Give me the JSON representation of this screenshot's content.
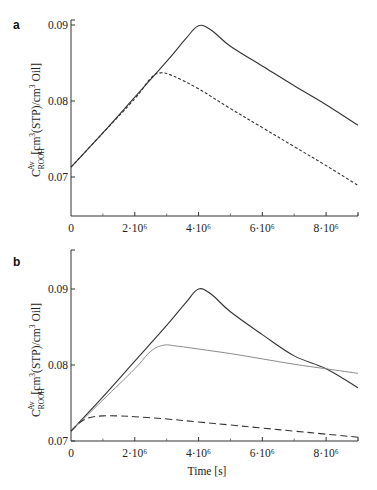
{
  "chart_data": [
    {
      "panel": "a",
      "type": "line",
      "title": "",
      "xlabel": "",
      "ylabel": "C_ROOH^Av [cm3(STP)/cm3 Oil]",
      "xlim": [
        0,
        9000000
      ],
      "ylim": [
        0.065,
        0.09
      ],
      "grid": false,
      "legend": null,
      "x_ticks": [
        0,
        2000000,
        4000000,
        6000000,
        8000000
      ],
      "x_tick_labels": [
        "0",
        "2·10⁶",
        "4·10⁶",
        "6·10⁶",
        "8·10⁶"
      ],
      "x_minor_ticks": [
        1000000,
        3000000,
        5000000,
        7000000,
        9000000
      ],
      "y_ticks": [
        0.07,
        0.08,
        0.09
      ],
      "y_tick_labels": [
        "0.07",
        "0.08",
        "0.09"
      ],
      "series": [
        {
          "name": "solid",
          "style": "solid",
          "color": "#333333",
          "x": [
            0,
            1000000,
            2000000,
            3000000,
            3600000,
            4000000,
            4400000,
            5000000,
            6000000,
            7000000,
            8000000,
            9000000
          ],
          "values": [
            0.0713,
            0.0758,
            0.0805,
            0.0852,
            0.0882,
            0.0899,
            0.0893,
            0.0872,
            0.0846,
            0.082,
            0.0795,
            0.0768
          ]
        },
        {
          "name": "dashed",
          "style": "dashed",
          "color": "#333333",
          "x": [
            0,
            1000000,
            2000000,
            2500000,
            2800000,
            3200000,
            4000000,
            5000000,
            6000000,
            7000000,
            8000000,
            9000000
          ],
          "values": [
            0.0713,
            0.0758,
            0.0803,
            0.083,
            0.0837,
            0.0833,
            0.0816,
            0.079,
            0.0765,
            0.074,
            0.0715,
            0.0689
          ]
        }
      ]
    },
    {
      "panel": "b",
      "type": "line",
      "title": "",
      "xlabel": "Time [s]",
      "ylabel": "C_ROOH^Av [cm3(STP)/cm3 Oil]",
      "xlim": [
        0,
        9000000
      ],
      "ylim": [
        0.07,
        0.095
      ],
      "grid": false,
      "legend": null,
      "x_ticks": [
        0,
        2000000,
        4000000,
        6000000,
        8000000
      ],
      "x_tick_labels": [
        "0",
        "2·10⁶",
        "4·10⁶",
        "6·10⁶",
        "8·10⁶"
      ],
      "x_minor_ticks": [
        1000000,
        3000000,
        5000000,
        7000000,
        9000000
      ],
      "y_ticks": [
        0.07,
        0.08,
        0.09
      ],
      "y_tick_labels": [
        "0.07",
        "0.08",
        "0.09"
      ],
      "series": [
        {
          "name": "solid",
          "style": "solid",
          "color": "#333333",
          "x": [
            0,
            1000000,
            2000000,
            3000000,
            3600000,
            4000000,
            4400000,
            5000000,
            6000000,
            7000000,
            8000000,
            9000000
          ],
          "values": [
            0.0713,
            0.0758,
            0.0805,
            0.0852,
            0.0882,
            0.09,
            0.0893,
            0.087,
            0.084,
            0.0812,
            0.0795,
            0.077
          ]
        },
        {
          "name": "dotted-gray",
          "style": "solid",
          "color": "#8a8a8a",
          "x": [
            0,
            1000000,
            2000000,
            2500000,
            2900000,
            3300000,
            4000000,
            5000000,
            6000000,
            7000000,
            8000000,
            9000000
          ],
          "values": [
            0.0713,
            0.0754,
            0.0795,
            0.0818,
            0.0826,
            0.0825,
            0.0821,
            0.0815,
            0.0808,
            0.0801,
            0.0795,
            0.0789
          ]
        },
        {
          "name": "dashed",
          "style": "dashed",
          "color": "#333333",
          "x": [
            0,
            300000,
            600000,
            1000000,
            1500000,
            2000000,
            3000000,
            4000000,
            5000000,
            6000000,
            7000000,
            8000000,
            9000000
          ],
          "values": [
            0.0713,
            0.0725,
            0.0731,
            0.0733,
            0.0733,
            0.0732,
            0.0729,
            0.0725,
            0.0721,
            0.0717,
            0.0713,
            0.0709,
            0.0705
          ]
        }
      ]
    }
  ],
  "labels": {
    "panel_a": "a",
    "panel_b": "b",
    "y_axis_symbol": "C",
    "y_axis_superscript": "Av",
    "y_axis_subscript": "ROOH",
    "y_axis_units_1": " [cm",
    "y_axis_units_sup1": "3",
    "y_axis_units_2": "(STP)/cm",
    "y_axis_units_sup2": "3",
    "y_axis_units_3": " Oil]",
    "x_axis_title": "Time [s]"
  }
}
